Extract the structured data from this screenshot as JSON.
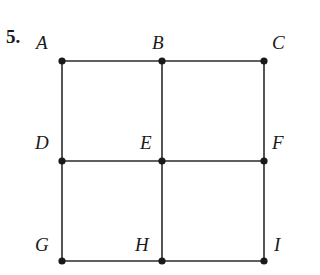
{
  "problem_number": "5.",
  "labels": {
    "A": "A",
    "B": "B",
    "C": "C",
    "D": "D",
    "E": "E",
    "F": "F",
    "G": "G",
    "H": "H",
    "I": "I"
  },
  "colors": {
    "line": "#2a2a2a",
    "point": "#1a1a1a"
  }
}
